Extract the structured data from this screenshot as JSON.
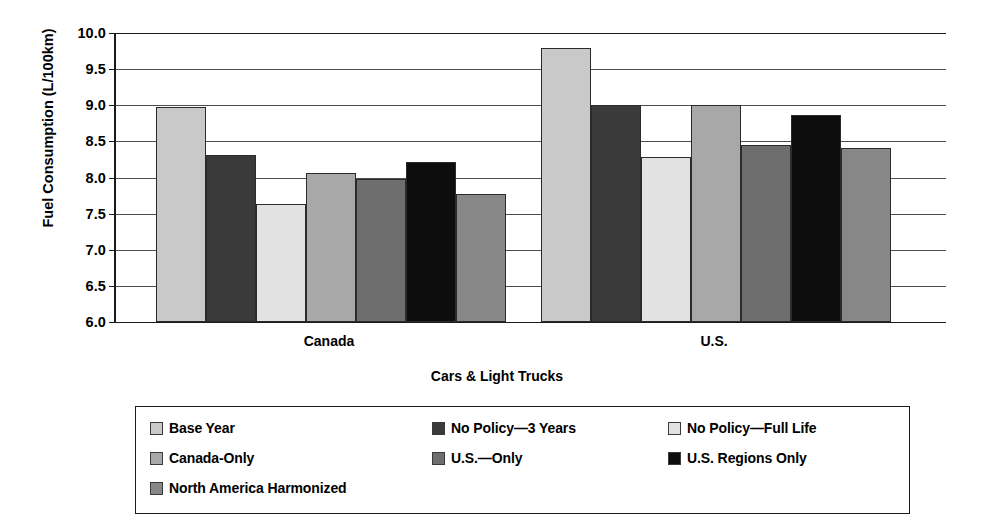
{
  "chart_data": {
    "type": "bar",
    "title": "",
    "xlabel": "Cars & Light Trucks",
    "ylabel": "Fuel Consumption (L/100km)",
    "ylim": [
      6.0,
      10.0
    ],
    "ytick_step": 0.5,
    "yticks": [
      "10.0",
      "9.5",
      "9.0",
      "8.5",
      "8.0",
      "7.5",
      "7.0",
      "6.5",
      "6.0"
    ],
    "grid": true,
    "legend_position": "bottom",
    "categories": [
      "Canada",
      "U.S."
    ],
    "series": [
      {
        "name": "Base Year",
        "color": "#c9c9c9",
        "values": [
          8.97,
          9.79
        ]
      },
      {
        "name": "No Policy—3 Years",
        "color": "#3a3a3a",
        "values": [
          8.31,
          9.01
        ]
      },
      {
        "name": "No Policy—Full Life",
        "color": "#e2e2e2",
        "values": [
          7.64,
          8.29
        ]
      },
      {
        "name": "Canada-Only",
        "color": "#a8a8a8",
        "values": [
          8.06,
          9.0
        ]
      },
      {
        "name": "U.S.—Only",
        "color": "#6e6e6e",
        "values": [
          7.98,
          8.45
        ]
      },
      {
        "name": "U.S. Regions Only",
        "color": "#0d0d0d",
        "values": [
          8.22,
          8.86
        ]
      },
      {
        "name": "North America Harmonized",
        "color": "#878787",
        "values": [
          7.77,
          8.41
        ]
      }
    ]
  }
}
